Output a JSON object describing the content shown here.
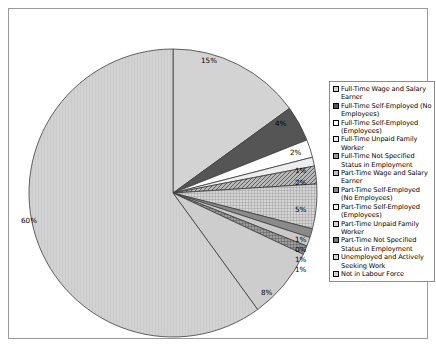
{
  "chart_data": {
    "type": "pie",
    "title": "",
    "legend_position": "right",
    "categories": [
      "Full-Time Wage and Salary Earner",
      "Full-Time Self-Employed (No Employees)",
      "Full-Time Self-Employed (Employees)",
      "Full-Time Unpaid Family Worker",
      "Full-Time Not Specified Status in Employment",
      "Part-Time Wage and Salary Earner",
      "Part-Time Self-Employed (No Employees)",
      "Part-Time Self-Employed (Employees)",
      "Part-Time Unpaid Family Worker",
      "Part-Time Not Specified Status in Employment",
      "Unemployed and Actively Seeking Work",
      "Not in Labour Force"
    ],
    "values": [
      15,
      4,
      2,
      1,
      2,
      5,
      1,
      0,
      1,
      1,
      8,
      60
    ],
    "data_labels": [
      "15%",
      "4%",
      "2%",
      "1%",
      "2%",
      "5%",
      "1%",
      "0%",
      "1%",
      "1%",
      "8%",
      "60%"
    ],
    "xlabel": "",
    "ylabel": ""
  },
  "legend": {
    "items": [
      {
        "label": "Full-Time Wage and Salary Earner",
        "swatch": "light-gray-solid"
      },
      {
        "label": "Full-Time Self-Employed (No Employees)",
        "swatch": "dark-gray-solid"
      },
      {
        "label": "Full-Time Self-Employed (Employees)",
        "swatch": "white-solid"
      },
      {
        "label": "Full-Time Unpaid Family Worker",
        "swatch": "very-light-gray-solid"
      },
      {
        "label": "Full-Time Not Specified Status in Employment",
        "swatch": "medium-gray-hatch"
      },
      {
        "label": "Part-Time Wage and Salary Earner",
        "swatch": "light-gray-grid"
      },
      {
        "label": "Part-Time Self-Employed (No Employees)",
        "swatch": "medium-gray-solid"
      },
      {
        "label": "Part-Time Self-Employed (Employees)",
        "swatch": "white-grid"
      },
      {
        "label": "Part-Time Unpaid Family Worker",
        "swatch": "light-gray-solid"
      },
      {
        "label": "Part-Time Not Specified Status in Employment",
        "swatch": "dark-gray-grid"
      },
      {
        "label": "Unemployed and Actively Seeking Work",
        "swatch": "light-gray-solid"
      },
      {
        "label": "Not in Labour Force",
        "swatch": "very-light-gray-vline"
      }
    ]
  },
  "labels": {
    "p15": "15%",
    "p4": "4%",
    "p2a": "2%",
    "p1a": "1%",
    "p2b": "2%",
    "p5": "5%",
    "p1b": "1%",
    "p0": "0%",
    "p1c": "1%",
    "p1d": "1%",
    "p8": "8%",
    "p60": "60%"
  },
  "colors": {
    "frame": "#9a9a9a",
    "legend_border": "#8c8c8c",
    "slice_outline": "#3c3c3c",
    "text": "#000000",
    "background": "#ffffff"
  }
}
